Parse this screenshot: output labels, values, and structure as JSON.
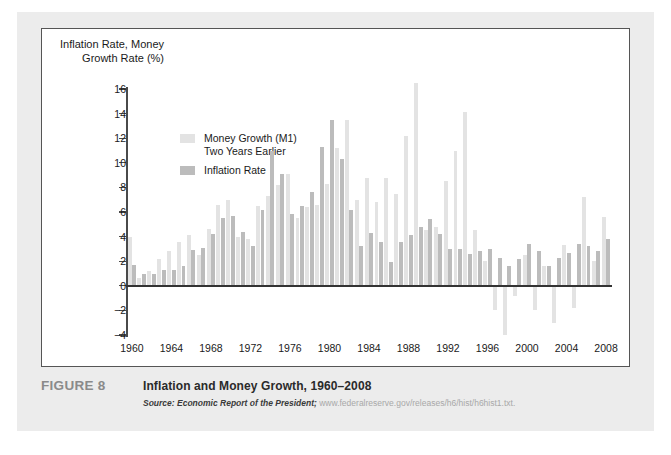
{
  "figure": {
    "number_label": "FIGURE 8",
    "title": "Inflation and Money Growth, 1960–2008",
    "source_label": "Source:",
    "source_publication": "Economic Report of the President;",
    "source_url": "www.federalreserve.gov/releases/h6/hist/h6hist1.txt."
  },
  "axis": {
    "y_title": "Inflation Rate,\nMoney Growth\nRate (%)",
    "y_ticks": [
      16,
      14,
      12,
      10,
      8,
      6,
      4,
      2,
      0,
      -2,
      -4
    ],
    "x_ticks": [
      1960,
      1964,
      1968,
      1972,
      1976,
      1980,
      1984,
      1988,
      1992,
      1996,
      2000,
      2004,
      2008
    ]
  },
  "legend": {
    "items": [
      {
        "label": "Money Growth (M1)\nTwo Years Earlier",
        "color": "#e3e3e3"
      },
      {
        "label": "Inflation Rate",
        "color": "#bcbcbc"
      }
    ]
  },
  "colors": {
    "money_growth": "#e3e3e3",
    "inflation": "#bcbcbc",
    "axis": "#4a4a4a",
    "zero_line": "#333333",
    "card_background": "#ececec",
    "plot_background": "#ffffff",
    "frame_border": "#555555"
  },
  "chart_data": {
    "type": "bar",
    "title": "Inflation and Money Growth, 1960–2008",
    "xlabel": "",
    "ylabel": "Inflation Rate, Money Growth Rate (%)",
    "ylim": [
      -4,
      16
    ],
    "xlim": [
      1960,
      2008
    ],
    "grid": false,
    "legend_position": "upper-left-inside",
    "categories": [
      1960,
      1961,
      1962,
      1963,
      1964,
      1965,
      1966,
      1967,
      1968,
      1969,
      1970,
      1971,
      1972,
      1973,
      1974,
      1975,
      1976,
      1977,
      1978,
      1979,
      1980,
      1981,
      1982,
      1983,
      1984,
      1985,
      1986,
      1987,
      1988,
      1989,
      1990,
      1991,
      1992,
      1993,
      1994,
      1995,
      1996,
      1997,
      1998,
      1999,
      2000,
      2001,
      2002,
      2003,
      2004,
      2005,
      2006,
      2007,
      2008
    ],
    "series": [
      {
        "name": "Money Growth (M1) Two Years Earlier",
        "color": "#e3e3e3",
        "values": [
          4.0,
          0.6,
          1.2,
          2.2,
          2.8,
          3.6,
          4.1,
          2.5,
          4.6,
          6.6,
          7.0,
          4.0,
          3.8,
          6.5,
          7.3,
          8.2,
          9.1,
          5.5,
          6.4,
          6.6,
          8.3,
          11.2,
          13.5,
          7.0,
          8.8,
          6.8,
          8.8,
          7.5,
          12.2,
          16.5,
          4.5,
          4.8,
          8.5,
          11.0,
          14.1,
          4.5,
          2.0,
          -2.0,
          -4.0,
          -0.8,
          2.5,
          -2.0,
          1.6,
          -3.0,
          3.3,
          -1.8,
          7.2,
          2.0,
          5.6
        ],
        "note": "M1 growth lagged two years; light gray bars; negative values 1997–1999, 2001, 2003, 2005"
      },
      {
        "name": "Inflation Rate",
        "color": "#bcbcbc",
        "values": [
          1.7,
          1.0,
          1.0,
          1.3,
          1.3,
          1.6,
          2.9,
          3.1,
          4.2,
          5.5,
          5.7,
          4.4,
          3.2,
          6.2,
          11.0,
          9.1,
          5.8,
          6.5,
          7.6,
          11.3,
          13.5,
          10.3,
          6.2,
          3.2,
          4.3,
          3.6,
          1.9,
          3.6,
          4.1,
          4.8,
          5.4,
          4.2,
          3.0,
          3.0,
          2.6,
          2.8,
          3.0,
          2.3,
          1.6,
          2.2,
          3.4,
          2.8,
          1.6,
          2.3,
          2.7,
          3.4,
          3.2,
          2.8,
          3.8
        ],
        "note": "CPI inflation rate; darker gray bars"
      }
    ]
  }
}
